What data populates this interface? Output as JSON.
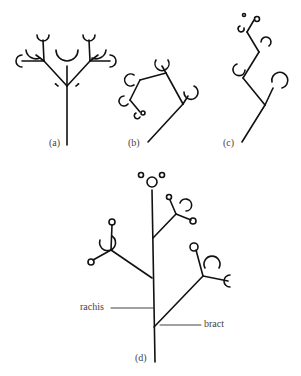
{
  "diagram": {
    "type": "botanical inflorescence diagrams",
    "panels": [
      {
        "id": "a",
        "label": "(a)"
      },
      {
        "id": "b",
        "label": "(b)"
      },
      {
        "id": "c",
        "label": "(c)"
      },
      {
        "id": "d",
        "label": "(d)"
      }
    ],
    "annotations": {
      "rachis": "rachis",
      "bract": "bract"
    },
    "colors": {
      "stroke": "#111111",
      "text": "#444444",
      "background": "#ffffff"
    }
  }
}
